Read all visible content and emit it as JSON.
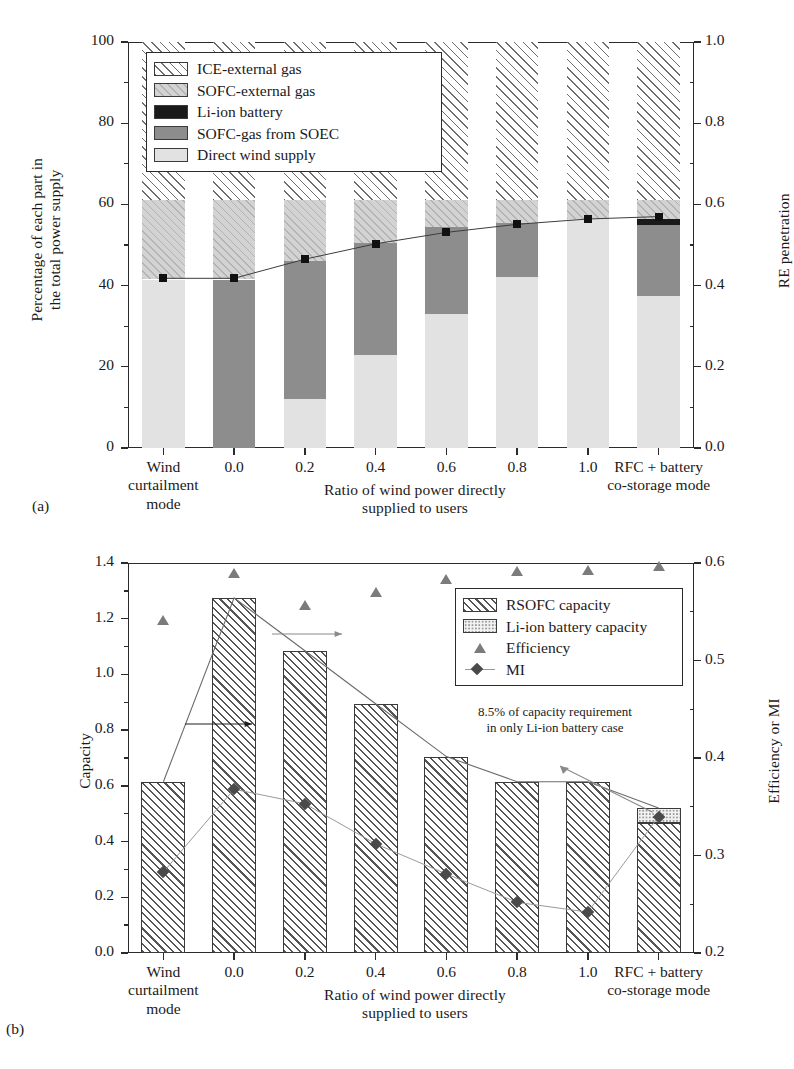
{
  "panel_a": {
    "label": "(a)",
    "ylabel_left": "Percentage of each part in\nthe total power supply",
    "ylabel_right": "RE penetration",
    "xlabel": "Ratio of wind power directly\nsupplied to users",
    "left_ticks": [
      "0",
      "20",
      "40",
      "60",
      "80",
      "100"
    ],
    "right_ticks": [
      "0.0",
      "0.2",
      "0.4",
      "0.6",
      "0.8",
      "1.0"
    ],
    "category_labels": [
      "Wind\ncurtailment\nmode",
      "0.0",
      "0.2",
      "0.4",
      "0.6",
      "0.8",
      "1.0",
      "RFC + battery\nco-storage mode"
    ],
    "legend": [
      {
        "label": "ICE-external gas",
        "key": "ice"
      },
      {
        "label": "SOFC-external gas",
        "key": "sofc_external"
      },
      {
        "label": "Li-ion battery",
        "key": "li_ion"
      },
      {
        "label": "SOFC-gas from SOEC",
        "key": "sofc_soec"
      },
      {
        "label": "Direct wind supply",
        "key": "direct_wind"
      }
    ]
  },
  "panel_b": {
    "label": "(b)",
    "ylabel_left": "Capacity",
    "ylabel_right": "Efficiency or MI",
    "xlabel": "Ratio of wind power directly\nsupplied to users",
    "left_ticks": [
      "0.0",
      "0.2",
      "0.4",
      "0.6",
      "0.8",
      "1.0",
      "1.2",
      "1.4"
    ],
    "right_ticks": [
      "0.2",
      "0.3",
      "0.4",
      "0.5",
      "0.6"
    ],
    "category_labels": [
      "Wind\ncurtailment\nmode",
      "0.0",
      "0.2",
      "0.4",
      "0.6",
      "0.8",
      "1.0",
      "RFC + battery\nco-storage mode"
    ],
    "legend": [
      {
        "label": "RSOFC capacity",
        "key": "rsofc"
      },
      {
        "label": "Li-ion battery capacity",
        "key": "li_bat"
      },
      {
        "label": "Efficiency",
        "key": "efficiency"
      },
      {
        "label": "MI",
        "key": "mi"
      }
    ],
    "annotation": "8.5% of capacity requirement\nin only Li-ion battery case"
  },
  "chart_data": [
    {
      "type": "bar",
      "id": "panel-a-stacked-bars",
      "title": "",
      "xlabel": "Ratio of wind power directly supplied to users",
      "ylabel": "Percentage of each part in the total power supply",
      "ylabel_secondary": "RE penetration",
      "ylim": [
        0,
        100
      ],
      "ylim_secondary": [
        0.0,
        1.0
      ],
      "yticks": [
        0,
        20,
        40,
        60,
        80,
        100
      ],
      "yticks_secondary": [
        0.0,
        0.2,
        0.4,
        0.6,
        0.8,
        1.0
      ],
      "grid": false,
      "stacked": true,
      "categories": [
        "Wind curtailment mode",
        "0.0",
        "0.2",
        "0.4",
        "0.6",
        "0.8",
        "1.0",
        "RFC + battery co-storage mode"
      ],
      "series": [
        {
          "name": "Direct wind supply",
          "color": "#e2e2e2",
          "values": [
            41.5,
            0,
            12.0,
            23.0,
            33.0,
            42.0,
            56.5,
            37.5
          ]
        },
        {
          "name": "SOFC-gas from SOEC",
          "color": "#8d8d8d",
          "values": [
            0,
            41.5,
            34.0,
            27.5,
            21.5,
            13.5,
            0,
            17.5
          ]
        },
        {
          "name": "Li-ion battery",
          "color": "#1a1a1a",
          "values": [
            0,
            0,
            0,
            0,
            0,
            0,
            0,
            1.5
          ]
        },
        {
          "name": "SOFC-external gas",
          "color": "#d3d3d3",
          "values": [
            19.5,
            19.5,
            15.0,
            10.5,
            6.5,
            5.5,
            4.5,
            4.5
          ]
        },
        {
          "name": "ICE-external gas",
          "color": "#ffffff",
          "values": [
            39.0,
            39.0,
            39.0,
            39.0,
            39.0,
            39.0,
            39.0,
            39.0
          ]
        }
      ],
      "overlay_series": [
        {
          "name": "RE penetration",
          "axis": "secondary",
          "marker": "square",
          "x": [
            "Wind curtailment mode",
            "0.0",
            "0.2",
            "0.4",
            "0.6",
            "0.8",
            "1.0",
            "RFC + battery co-storage mode"
          ],
          "values": [
            0.418,
            0.418,
            0.465,
            0.503,
            0.531,
            0.551,
            0.564,
            0.57
          ]
        }
      ]
    },
    {
      "type": "bar",
      "id": "panel-b-capacity-bars",
      "title": "",
      "xlabel": "Ratio of wind power directly supplied to users",
      "ylabel": "Capacity",
      "ylabel_secondary": "Efficiency or MI",
      "ylim": [
        0.0,
        1.4
      ],
      "ylim_secondary": [
        0.2,
        0.6
      ],
      "yticks": [
        0.0,
        0.2,
        0.4,
        0.6,
        0.8,
        1.0,
        1.2,
        1.4
      ],
      "yticks_secondary": [
        0.2,
        0.3,
        0.4,
        0.5,
        0.6
      ],
      "grid": false,
      "stacked": true,
      "categories": [
        "Wind curtailment mode",
        "0.0",
        "0.2",
        "0.4",
        "0.6",
        "0.8",
        "1.0",
        "RFC + battery co-storage mode"
      ],
      "series": [
        {
          "name": "RSOFC capacity",
          "color": "#ffffff",
          "values": [
            0.615,
            1.275,
            1.085,
            0.895,
            0.705,
            0.615,
            0.615,
            0.465
          ]
        },
        {
          "name": "Li-ion battery capacity",
          "color": "#f2f2f2",
          "values": [
            0,
            0,
            0,
            0,
            0,
            0,
            0,
            0.055
          ]
        }
      ],
      "overlay_series": [
        {
          "name": "Efficiency",
          "axis": "secondary",
          "marker": "triangle",
          "x": [
            "Wind curtailment mode",
            "0.0",
            "0.2",
            "0.4",
            "0.6",
            "0.8",
            "1.0",
            "RFC + battery co-storage mode"
          ],
          "values": [
            0.542,
            0.59,
            0.557,
            0.57,
            0.584,
            0.592,
            0.593,
            0.597
          ]
        },
        {
          "name": "MI",
          "axis": "secondary",
          "marker": "diamond",
          "x": [
            "Wind curtailment mode",
            "0.0",
            "0.2",
            "0.4",
            "0.6",
            "0.8",
            "1.0",
            "RFC + battery co-storage mode"
          ],
          "values": [
            0.283,
            0.368,
            0.353,
            0.312,
            0.281,
            0.252,
            0.242,
            0.34
          ]
        }
      ],
      "annotations": [
        {
          "text": "8.5% of capacity requirement in only Li-ion battery case",
          "points_to": "RFC + battery co-storage mode"
        }
      ]
    }
  ]
}
